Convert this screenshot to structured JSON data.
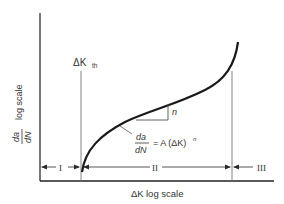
{
  "diagram": {
    "y_axis": {
      "label_numerator": "da",
      "label_denominator": "dN",
      "label_suffix": "log scale"
    },
    "x_axis": {
      "label_prefix": "ΔK",
      "label_suffix": "log scale"
    },
    "threshold_label": {
      "main": "ΔK",
      "subscript": "th"
    },
    "slope_label": "n",
    "equation": {
      "numerator": "da",
      "denominator": "dN",
      "rhs": "= A (ΔK)",
      "exponent": "n"
    },
    "regions": [
      {
        "label": "I"
      },
      {
        "label": "II"
      },
      {
        "label": "III"
      }
    ],
    "colors": {
      "curve": "#1a1a1a",
      "axes": "#2a2a2a",
      "guides": "#555555",
      "text": "#333333"
    }
  }
}
